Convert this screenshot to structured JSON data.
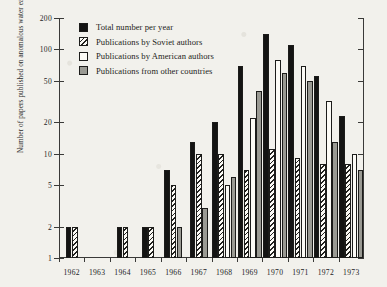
{
  "chart_data": {
    "type": "bar",
    "title": "",
    "xlabel": "",
    "ylabel": "Number of papers published on anomalous water each year (logarithmic scale)",
    "ylabel_visible_text": "water' each year (logarithmic scale)",
    "scale": "logarithmic",
    "ylim": [
      1,
      200
    ],
    "ytick_labels": [
      "200",
      "100",
      "50",
      "20",
      "10",
      "5",
      "2",
      "1"
    ],
    "ytick_values": [
      200,
      100,
      50,
      20,
      10,
      5,
      2,
      1
    ],
    "grid": false,
    "legend_position": "top-left",
    "categories": [
      "1962",
      "1963",
      "1964",
      "1965",
      "1966",
      "1967",
      "1968",
      "1969",
      "1970",
      "1971",
      "1972",
      "1973"
    ],
    "series": [
      {
        "name": "Total number per year",
        "key": "total",
        "color": "#141413",
        "values": [
          2,
          null,
          2,
          2,
          7,
          13,
          20,
          70,
          140,
          110,
          55,
          23
        ]
      },
      {
        "name": "Publications by Soviet authors",
        "key": "soviet",
        "color": "#fbfaf5",
        "values": [
          2,
          null,
          2,
          2,
          5,
          10,
          10,
          7,
          11,
          9,
          8,
          8
        ]
      },
      {
        "name": "Publications by American authors",
        "key": "american",
        "color": "#fcfbf6",
        "values": [
          null,
          null,
          null,
          null,
          null,
          null,
          5,
          22,
          80,
          70,
          32,
          10
        ]
      },
      {
        "name": "Publications from other countries",
        "key": "other",
        "color": "#9a9a93",
        "values": [
          null,
          null,
          null,
          null,
          2,
          3,
          6,
          40,
          60,
          50,
          13,
          7
        ]
      }
    ]
  },
  "legend": {
    "items": [
      {
        "label": "Total number per year",
        "swatch": "total"
      },
      {
        "label": "Publications by Soviet authors",
        "swatch": "soviet"
      },
      {
        "label": "Publications by American authors",
        "swatch": "american"
      },
      {
        "label": "Publications from other countries",
        "swatch": "other"
      }
    ]
  }
}
